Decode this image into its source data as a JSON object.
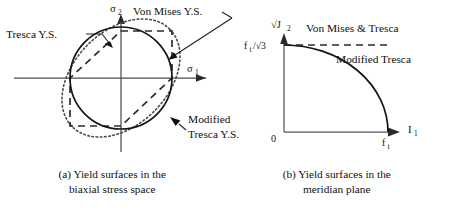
{
  "figure": {
    "panel_a": {
      "axis_x_label": "σ",
      "axis_x_sub": "1",
      "axis_y_label": "σ",
      "axis_y_sub": "2",
      "annotations": {
        "tresca": "Tresca Y.S.",
        "von_mises": "Von Mises Y.S.",
        "modified_line1": "Modified",
        "modified_line2": "Tresca Y.S."
      }
    },
    "panel_b": {
      "axis_y_label": "√J",
      "axis_y_sub": "2",
      "axis_x_label": "I",
      "axis_x_sub": "1",
      "origin_label": "0",
      "tick_y_label": "f",
      "tick_y_sub": "t",
      "tick_y_rest": "/√3",
      "tick_x_label": "f",
      "tick_x_sub": "t",
      "annotations": {
        "von_mises_tresca": "Von Mises & Tresca",
        "modified_tresca": "Modified Tresca"
      }
    },
    "captions": {
      "a_line1": "(a) Yield surfaces in the",
      "a_line2": "biaxial stress space",
      "b_line1": "(b) Yield surfaces in the",
      "b_line2": "meridian plane"
    }
  }
}
